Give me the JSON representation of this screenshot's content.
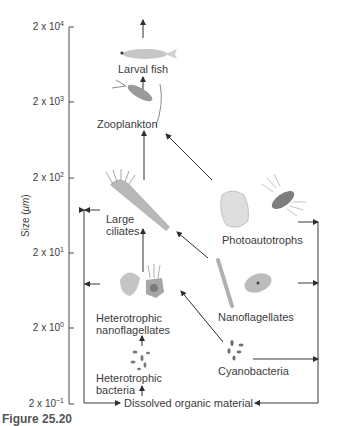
{
  "diagram": {
    "type": "food-web",
    "y_axis": {
      "label_prefix": "Size (",
      "label_unit": "μm",
      "label_suffix": ")",
      "ticks": [
        {
          "base": "2 x 10",
          "exp": "4"
        },
        {
          "base": "2 x 10",
          "exp": "3"
        },
        {
          "base": "2 x 10",
          "exp": "2"
        },
        {
          "base": "2 x 10",
          "exp": "1"
        },
        {
          "base": "2 x 10",
          "exp": "0"
        },
        {
          "base": "2 x 10",
          "exp": "−1"
        }
      ]
    },
    "nodes": {
      "larval_fish": "Larval fish",
      "zooplankton": "Zooplankton",
      "large_ciliates_1": "Large",
      "large_ciliates_2": "ciliates",
      "photoautotrophs": "Photoautotrophs",
      "het_nano_1": "Heterotrophic",
      "het_nano_2": "nanoflagellates",
      "nanoflagellates": "Nanoflagellates",
      "het_bact_1": "Heterotrophic",
      "het_bact_2": "bacteria",
      "cyanobacteria": "Cyanobacteria",
      "dom": "Dissolved organic material"
    },
    "edges": [
      {
        "from": "Larval fish",
        "to": "(higher consumers)"
      },
      {
        "from": "Zooplankton",
        "to": "Larval fish"
      },
      {
        "from": "Large ciliates",
        "to": "Zooplankton"
      },
      {
        "from": "Photoautotrophs",
        "to": "Zooplankton"
      },
      {
        "from": "Heterotrophic nanoflagellates",
        "to": "Large ciliates"
      },
      {
        "from": "Nanoflagellates",
        "to": "Large ciliates"
      },
      {
        "from": "Heterotrophic bacteria",
        "to": "Heterotrophic nanoflagellates"
      },
      {
        "from": "Cyanobacteria",
        "to": "Heterotrophic nanoflagellates"
      },
      {
        "from": "Dissolved organic material",
        "to": "Heterotrophic bacteria"
      },
      {
        "from": "Large ciliates",
        "to": "Dissolved organic material"
      },
      {
        "from": "Heterotrophic nanoflagellates",
        "to": "Dissolved organic material"
      },
      {
        "from": "Photoautotrophs",
        "to": "Dissolved organic material"
      },
      {
        "from": "Nanoflagellates",
        "to": "Dissolved organic material"
      },
      {
        "from": "Cyanobacteria",
        "to": "Dissolved organic material"
      }
    ],
    "caption": "Figure 25.20"
  },
  "colors": {
    "line": "#3a3a3a",
    "text": "#3c3c3c",
    "organism_light": "#c9c9c9",
    "organism_mid": "#9a9a9a",
    "organism_dark": "#6e6e6e"
  }
}
